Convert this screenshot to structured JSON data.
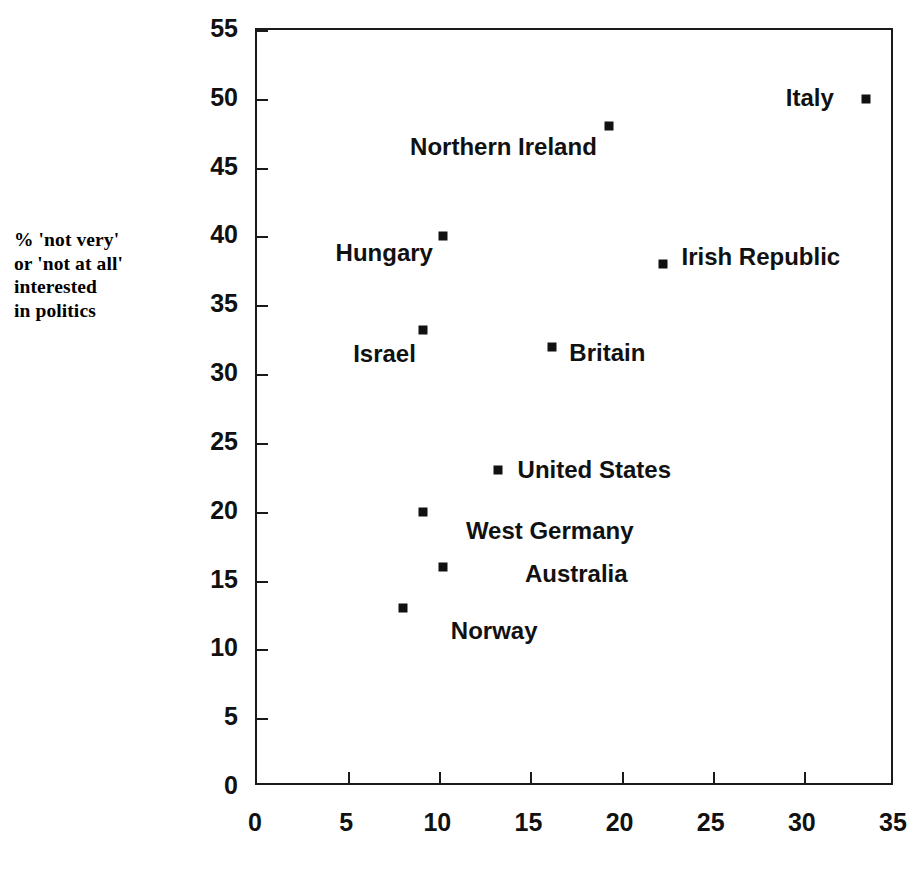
{
  "chart_data": {
    "type": "scatter",
    "title": "",
    "subtitle": "",
    "xlabel": "",
    "ylabel": "% 'not very'\nor 'not at all'\ninterested\nin politics",
    "xlim": [
      0,
      35
    ],
    "ylim": [
      0,
      55
    ],
    "xticks": [
      0,
      5,
      10,
      15,
      20,
      25,
      30,
      35
    ],
    "yticks": [
      0,
      5,
      10,
      15,
      20,
      25,
      30,
      35,
      40,
      45,
      50,
      55
    ],
    "xtick_labels": [
      "0",
      "5",
      "10",
      "15",
      "20",
      "25",
      "30",
      "35"
    ],
    "ytick_labels": [
      "0",
      "5",
      "10",
      "15",
      "20",
      "25",
      "30",
      "35",
      "40",
      "45",
      "50",
      "55"
    ],
    "grid": false,
    "legend": "none",
    "tick_direction": "in",
    "marker": "square",
    "points": [
      {
        "label": "Italy",
        "x": 33.4,
        "y": 50.0,
        "label_pos": "left",
        "label_dx": -32,
        "label_dy": -1
      },
      {
        "label": "Northern Ireland",
        "x": 19.3,
        "y": 48.0,
        "label_pos": "left",
        "label_dx": -12,
        "label_dy": 21
      },
      {
        "label": "Hungary",
        "x": 10.2,
        "y": 40.0,
        "label_pos": "left",
        "label_dx": -10,
        "label_dy": 17
      },
      {
        "label": "Irish Republic",
        "x": 22.3,
        "y": 38.0,
        "label_pos": "right",
        "label_dx": 18,
        "label_dy": -7
      },
      {
        "label": "Israel",
        "x": 9.1,
        "y": 33.2,
        "label_pos": "left",
        "label_dx": -7,
        "label_dy": 24
      },
      {
        "label": "Britain",
        "x": 16.2,
        "y": 32.0,
        "label_pos": "right",
        "label_dx": 17,
        "label_dy": 6
      },
      {
        "label": "United States",
        "x": 13.2,
        "y": 23.0,
        "label_pos": "right",
        "label_dx": 20,
        "label_dy": 0
      },
      {
        "label": "West Germany",
        "x": 9.1,
        "y": 20.0,
        "label_pos": "right",
        "label_dx": 43,
        "label_dy": 19
      },
      {
        "label": "Australia",
        "x": 10.2,
        "y": 16.0,
        "label_pos": "right",
        "label_dx": 82,
        "label_dy": 7
      },
      {
        "label": "Norway",
        "x": 8.0,
        "y": 13.0,
        "label_pos": "right",
        "label_dx": 48,
        "label_dy": 23
      }
    ],
    "colors": {
      "marker": "#111111",
      "axis": "#1a1a1a",
      "text": "#111111",
      "background": "#ffffff"
    }
  }
}
